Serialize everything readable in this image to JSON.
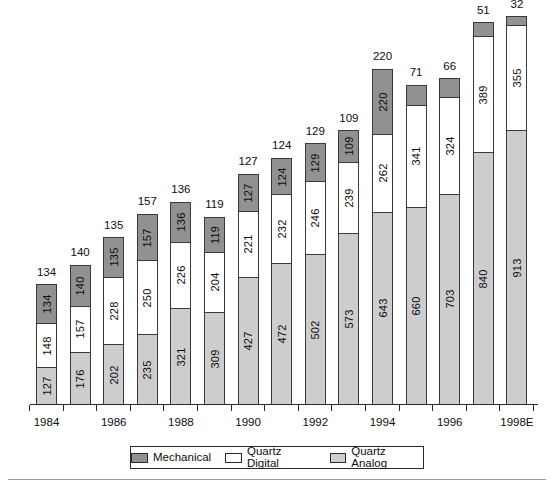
{
  "chart_data": {
    "type": "bar",
    "stacked": true,
    "title": "",
    "subtitle": "",
    "xlabel": "",
    "ylabel": "",
    "grid": false,
    "ylim": [
      0,
      1320
    ],
    "legend_position": "bottom",
    "categories": [
      "1984",
      "1985",
      "1986",
      "1987",
      "1988",
      "1989",
      "1990",
      "1991",
      "1992",
      "1993",
      "1994",
      "1995",
      "1996",
      "1997",
      "1998E"
    ],
    "tick_labels": [
      "1984",
      "",
      "1986",
      "",
      "1988",
      "",
      "1990",
      "",
      "1992",
      "",
      "1994",
      "",
      "1996",
      "",
      "1998E"
    ],
    "series": [
      {
        "name": "Quartz Analog",
        "color": "#cdcdcd",
        "values": [
          127,
          176,
          202,
          235,
          321,
          309,
          427,
          472,
          502,
          573,
          643,
          660,
          703,
          840,
          913
        ]
      },
      {
        "name": "Quartz Digital",
        "color": "#ffffff",
        "values": [
          148,
          157,
          228,
          250,
          226,
          204,
          221,
          232,
          246,
          239,
          262,
          341,
          324,
          389,
          355
        ]
      },
      {
        "name": "Mechanical",
        "color": "#919191",
        "values": [
          134,
          140,
          135,
          157,
          136,
          119,
          127,
          124,
          129,
          109,
          220,
          71,
          66,
          51,
          32
        ]
      }
    ],
    "totals": [
      409,
      473,
      565,
      642,
      683,
      632,
      775,
      828,
      877,
      921,
      1125,
      1072,
      1093,
      1280,
      1300
    ]
  },
  "legend": {
    "items": [
      {
        "label": "Mechanical",
        "swatch": "mech"
      },
      {
        "label": "Quartz Digital",
        "swatch": "qd"
      },
      {
        "label": "Quartz Analog",
        "swatch": "qa"
      }
    ]
  },
  "colors": {
    "mechanical": "#919191",
    "quartz_digital": "#ffffff",
    "quartz_analog": "#cdcdcd",
    "outline": "#2a2a2a"
  }
}
